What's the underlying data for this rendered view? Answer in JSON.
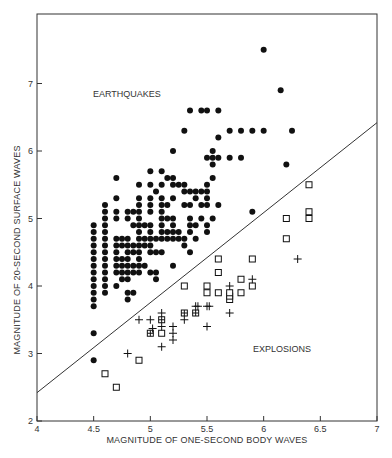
{
  "chart_data": {
    "type": "scatter",
    "title": "",
    "xlabel": "MAGNITUDE OF ONE-SECOND BODY WAVES",
    "ylabel": "MAGNITUDE OF 20-SECOND SURFACE WAVES",
    "xlim": [
      4,
      7
    ],
    "ylim": [
      2,
      8
    ],
    "xticks": [
      "4",
      "4.5",
      "5",
      "5.5",
      "6",
      "6.5",
      "7"
    ],
    "yticks": [
      "2",
      "3",
      "4",
      "5",
      "6",
      "7"
    ],
    "grid": false,
    "annotations": [
      {
        "text": "EARTHQUAKES",
        "x": 4.6,
        "y": 6.82
      },
      {
        "text": "EXPLOSIONS",
        "x": 5.7,
        "y": 3.38
      }
    ],
    "discriminant_line": {
      "x": [
        4.0,
        7.0
      ],
      "y": [
        2.42,
        6.42
      ]
    },
    "series": [
      {
        "name": "Earthquakes",
        "marker": "filled-circle",
        "points": [
          [
            4.5,
            2.9
          ],
          [
            4.5,
            3.3
          ],
          [
            4.5,
            3.7
          ],
          [
            4.5,
            3.8
          ],
          [
            4.5,
            3.9
          ],
          [
            4.5,
            4.0
          ],
          [
            4.5,
            4.1
          ],
          [
            4.5,
            4.2
          ],
          [
            4.5,
            4.3
          ],
          [
            4.5,
            4.4
          ],
          [
            4.5,
            4.5
          ],
          [
            4.5,
            4.6
          ],
          [
            4.5,
            4.7
          ],
          [
            4.5,
            4.8
          ],
          [
            4.5,
            4.9
          ],
          [
            4.6,
            3.9
          ],
          [
            4.6,
            4.0
          ],
          [
            4.6,
            4.1
          ],
          [
            4.6,
            4.2
          ],
          [
            4.6,
            4.3
          ],
          [
            4.6,
            4.4
          ],
          [
            4.6,
            4.5
          ],
          [
            4.6,
            4.6
          ],
          [
            4.6,
            4.7
          ],
          [
            4.6,
            4.8
          ],
          [
            4.6,
            4.9
          ],
          [
            4.6,
            5.0
          ],
          [
            4.6,
            5.1
          ],
          [
            4.6,
            5.2
          ],
          [
            4.7,
            4.0
          ],
          [
            4.7,
            4.2
          ],
          [
            4.7,
            4.3
          ],
          [
            4.7,
            4.4
          ],
          [
            4.7,
            4.5
          ],
          [
            4.7,
            4.6
          ],
          [
            4.7,
            4.7
          ],
          [
            4.7,
            5.0
          ],
          [
            4.7,
            5.1
          ],
          [
            4.7,
            5.3
          ],
          [
            4.7,
            5.6
          ],
          [
            4.75,
            4.1
          ],
          [
            4.75,
            4.2
          ],
          [
            4.75,
            4.3
          ],
          [
            4.75,
            4.4
          ],
          [
            4.75,
            4.6
          ],
          [
            4.75,
            4.7
          ],
          [
            4.8,
            3.8
          ],
          [
            4.8,
            3.9
          ],
          [
            4.8,
            4.1
          ],
          [
            4.8,
            4.2
          ],
          [
            4.8,
            4.3
          ],
          [
            4.8,
            4.4
          ],
          [
            4.8,
            4.5
          ],
          [
            4.8,
            4.6
          ],
          [
            4.8,
            4.7
          ],
          [
            4.8,
            5.0
          ],
          [
            4.8,
            5.1
          ],
          [
            4.85,
            3.9
          ],
          [
            4.85,
            4.2
          ],
          [
            4.85,
            4.3
          ],
          [
            4.85,
            4.5
          ],
          [
            4.85,
            4.6
          ],
          [
            4.85,
            4.9
          ],
          [
            4.85,
            5.1
          ],
          [
            4.9,
            4.2
          ],
          [
            4.9,
            4.3
          ],
          [
            4.9,
            4.4
          ],
          [
            4.9,
            4.5
          ],
          [
            4.9,
            4.6
          ],
          [
            4.9,
            4.7
          ],
          [
            4.9,
            4.8
          ],
          [
            4.9,
            4.9
          ],
          [
            4.9,
            5.0
          ],
          [
            4.9,
            5.1
          ],
          [
            4.9,
            5.2
          ],
          [
            4.9,
            5.3
          ],
          [
            4.9,
            5.5
          ],
          [
            4.95,
            4.3
          ],
          [
            4.95,
            4.6
          ],
          [
            4.95,
            4.7
          ],
          [
            4.95,
            4.9
          ],
          [
            5.0,
            4.2
          ],
          [
            5.0,
            4.5
          ],
          [
            5.0,
            4.6
          ],
          [
            5.0,
            4.7
          ],
          [
            5.0,
            4.8
          ],
          [
            5.0,
            4.9
          ],
          [
            5.0,
            5.1
          ],
          [
            5.0,
            5.2
          ],
          [
            5.0,
            5.3
          ],
          [
            5.0,
            5.5
          ],
          [
            5.0,
            5.7
          ],
          [
            5.05,
            4.1
          ],
          [
            5.05,
            4.2
          ],
          [
            5.05,
            4.5
          ],
          [
            5.05,
            4.7
          ],
          [
            5.05,
            5.4
          ],
          [
            5.1,
            4.5
          ],
          [
            5.1,
            4.7
          ],
          [
            5.1,
            4.8
          ],
          [
            5.1,
            4.9
          ],
          [
            5.1,
            5.0
          ],
          [
            5.1,
            5.1
          ],
          [
            5.1,
            5.2
          ],
          [
            5.1,
            5.3
          ],
          [
            5.1,
            5.5
          ],
          [
            5.1,
            5.7
          ],
          [
            5.15,
            4.7
          ],
          [
            5.15,
            4.8
          ],
          [
            5.15,
            5.0
          ],
          [
            5.15,
            5.2
          ],
          [
            5.15,
            5.6
          ],
          [
            5.2,
            4.3
          ],
          [
            5.2,
            4.7
          ],
          [
            5.2,
            4.8
          ],
          [
            5.2,
            4.9
          ],
          [
            5.2,
            5.0
          ],
          [
            5.2,
            5.3
          ],
          [
            5.2,
            5.5
          ],
          [
            5.2,
            5.6
          ],
          [
            5.2,
            6.0
          ],
          [
            5.25,
            4.7
          ],
          [
            5.25,
            4.8
          ],
          [
            5.25,
            5.5
          ],
          [
            5.3,
            4.6
          ],
          [
            5.3,
            4.7
          ],
          [
            5.3,
            5.2
          ],
          [
            5.3,
            5.4
          ],
          [
            5.3,
            5.5
          ],
          [
            5.3,
            6.3
          ],
          [
            5.35,
            4.5
          ],
          [
            5.35,
            4.8
          ],
          [
            5.35,
            4.9
          ],
          [
            5.35,
            5.0
          ],
          [
            5.35,
            5.2
          ],
          [
            5.35,
            5.4
          ],
          [
            5.35,
            6.6
          ],
          [
            5.4,
            4.7
          ],
          [
            5.4,
            4.9
          ],
          [
            5.4,
            5.4
          ],
          [
            5.4,
            5.3
          ],
          [
            5.45,
            5.0
          ],
          [
            5.45,
            5.2
          ],
          [
            5.45,
            5.4
          ],
          [
            5.45,
            6.6
          ],
          [
            5.5,
            4.8
          ],
          [
            5.5,
            4.9
          ],
          [
            5.5,
            5.2
          ],
          [
            5.5,
            5.3
          ],
          [
            5.5,
            5.4
          ],
          [
            5.5,
            5.5
          ],
          [
            5.5,
            5.9
          ],
          [
            5.5,
            6.6
          ],
          [
            5.55,
            5.0
          ],
          [
            5.55,
            5.6
          ],
          [
            5.55,
            5.8
          ],
          [
            5.55,
            5.9
          ],
          [
            5.55,
            6.0
          ],
          [
            5.6,
            5.2
          ],
          [
            5.6,
            5.9
          ],
          [
            5.6,
            6.2
          ],
          [
            5.6,
            6.6
          ],
          [
            5.7,
            5.9
          ],
          [
            5.7,
            6.3
          ],
          [
            5.8,
            5.9
          ],
          [
            5.8,
            6.3
          ],
          [
            5.9,
            5.1
          ],
          [
            5.9,
            6.3
          ],
          [
            6.0,
            7.5
          ],
          [
            6.0,
            6.3
          ],
          [
            6.15,
            6.9
          ],
          [
            6.2,
            5.8
          ],
          [
            6.25,
            6.3
          ]
        ]
      },
      {
        "name": "Explosions (open squares)",
        "marker": "open-square",
        "points": [
          [
            4.6,
            2.7
          ],
          [
            4.7,
            2.5
          ],
          [
            4.9,
            2.9
          ],
          [
            5.1,
            3.3
          ],
          [
            5.3,
            4.0
          ],
          [
            5.5,
            3.9
          ],
          [
            5.5,
            4.0
          ],
          [
            5.6,
            3.9
          ],
          [
            5.6,
            4.2
          ],
          [
            5.6,
            4.4
          ],
          [
            5.7,
            3.8
          ],
          [
            5.7,
            3.85
          ],
          [
            5.7,
            3.9
          ],
          [
            5.8,
            3.9
          ],
          [
            5.8,
            4.1
          ],
          [
            5.9,
            4.0
          ],
          [
            5.9,
            4.4
          ],
          [
            6.2,
            4.7
          ],
          [
            6.2,
            5.0
          ],
          [
            6.4,
            5.0
          ],
          [
            6.4,
            5.1
          ],
          [
            6.4,
            5.5
          ]
        ]
      },
      {
        "name": "Explosions (boxed plus)",
        "marker": "boxed-plus",
        "points": [
          [
            5.0,
            3.3
          ],
          [
            5.1,
            3.5
          ],
          [
            5.3,
            3.6
          ],
          [
            5.4,
            3.6
          ]
        ]
      },
      {
        "name": "Explosions (crosses)",
        "marker": "plus",
        "points": [
          [
            4.8,
            3.0
          ],
          [
            4.9,
            3.5
          ],
          [
            5.0,
            3.5
          ],
          [
            5.02,
            3.37
          ],
          [
            5.1,
            3.1
          ],
          [
            5.1,
            3.4
          ],
          [
            5.1,
            3.6
          ],
          [
            5.2,
            3.2
          ],
          [
            5.2,
            3.3
          ],
          [
            5.2,
            3.4
          ],
          [
            5.3,
            3.5
          ],
          [
            5.4,
            3.7
          ],
          [
            5.42,
            3.7
          ],
          [
            5.5,
            3.4
          ],
          [
            5.5,
            3.7
          ],
          [
            5.52,
            3.7
          ],
          [
            5.7,
            3.6
          ],
          [
            5.7,
            4.0
          ],
          [
            5.9,
            4.1
          ],
          [
            6.3,
            4.4
          ]
        ]
      }
    ]
  },
  "colors": {
    "marker": "#111111",
    "axis": "#333333",
    "line": "#333333",
    "background": "#ffffff"
  },
  "plot": {
    "px_left": 37,
    "px_right": 377,
    "px_top": 14,
    "px_bottom": 421
  }
}
